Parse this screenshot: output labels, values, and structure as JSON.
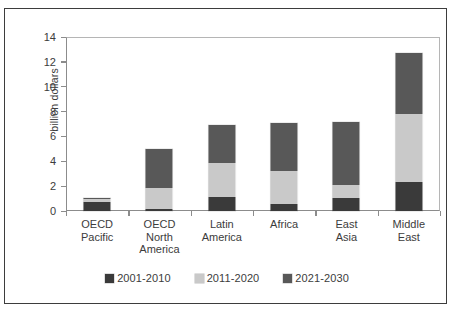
{
  "figure": {
    "cropped_header_text": "",
    "background": "#ffffff",
    "border_color": "#3d3d3d"
  },
  "chart_data": {
    "type": "bar",
    "subtype": "stacked-vertical",
    "title": "",
    "xlabel": "",
    "ylabel": "billion dollars",
    "ylim": [
      0,
      14
    ],
    "yticks": [
      0,
      2,
      4,
      6,
      8,
      10,
      12,
      14
    ],
    "ytick_labels": [
      "0",
      "2",
      "4",
      "6",
      "8",
      "10",
      "12",
      "14"
    ],
    "grid": false,
    "legend_position": "bottom-center",
    "categories": [
      "OECD Pacific",
      "OECD North America",
      "Latin America",
      "Africa",
      "East Asia",
      "Middle East"
    ],
    "category_lines": [
      [
        "OECD",
        "Pacific"
      ],
      [
        "OECD",
        "North",
        "America"
      ],
      [
        "Latin",
        "America"
      ],
      [
        "Africa"
      ],
      [
        "East",
        "Asia"
      ],
      [
        "Middle",
        "East"
      ]
    ],
    "series": [
      {
        "name": "2001-2010",
        "color": "#3a3a3a",
        "values": [
          0.7,
          0.2,
          1.15,
          0.6,
          1.05,
          2.35
        ]
      },
      {
        "name": "2011-2020",
        "color": "#c9c9c9",
        "values": [
          0.25,
          1.65,
          2.7,
          2.6,
          1.05,
          5.45
        ]
      },
      {
        "name": "2021-2030",
        "color": "#585858",
        "values": [
          0.1,
          3.15,
          3.05,
          3.85,
          5.1,
          4.9
        ]
      }
    ],
    "totals": [
      1.05,
      5.0,
      6.9,
      7.05,
      7.2,
      12.7
    ]
  },
  "legend": {
    "items": [
      {
        "label": "2001-2010",
        "color": "#3a3a3a"
      },
      {
        "label": "2011-2020",
        "color": "#c9c9c9"
      },
      {
        "label": "2021-2030",
        "color": "#585858"
      }
    ]
  }
}
